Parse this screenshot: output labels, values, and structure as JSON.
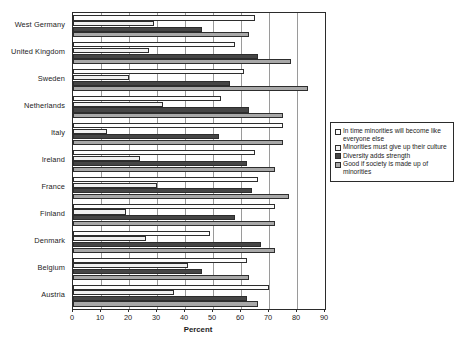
{
  "chart_data": {
    "type": "bar",
    "orientation": "horizontal",
    "title": "",
    "xlabel": "Percent",
    "ylabel": "",
    "xlim": [
      0,
      90
    ],
    "xticks": [
      0,
      10,
      20,
      30,
      40,
      50,
      60,
      70,
      80,
      90
    ],
    "grid": true,
    "legend_position": "right",
    "categories": [
      "West Germany",
      "United Kingdom",
      "Sweden",
      "Netherlands",
      "Italy",
      "Ireland",
      "France",
      "Finland",
      "Denmark",
      "Belgium",
      "Austria"
    ],
    "series": [
      {
        "name": "In time minorities will become like everyone else",
        "color": "#fdfdfd",
        "values": [
          65,
          58,
          61,
          53,
          75,
          65,
          66,
          72,
          49,
          62,
          70
        ]
      },
      {
        "name": "Minorities must give up their culture",
        "color": "#f0f0f0",
        "values": [
          29,
          27,
          20,
          32,
          12,
          24,
          30,
          19,
          26,
          41,
          36
        ]
      },
      {
        "name": "Diversity adds strength",
        "color": "#454545",
        "values": [
          46,
          66,
          56,
          63,
          52,
          62,
          64,
          58,
          67,
          46,
          62
        ]
      },
      {
        "name": "Good if society is made up of minorities",
        "color": "#a8a8a8",
        "values": [
          63,
          78,
          84,
          75,
          75,
          72,
          77,
          72,
          72,
          63,
          66
        ]
      }
    ]
  },
  "legend": {
    "items": [
      {
        "label": "In time minorities will become like everyone else",
        "swatch": "#fdfdfd"
      },
      {
        "label": "Minorities must give up their culture",
        "swatch": "#f0f0f0"
      },
      {
        "label": "Diversity adds strength",
        "swatch": "#454545"
      },
      {
        "label": "Good if society is made up of minorities",
        "swatch": "#a8a8a8"
      }
    ]
  }
}
